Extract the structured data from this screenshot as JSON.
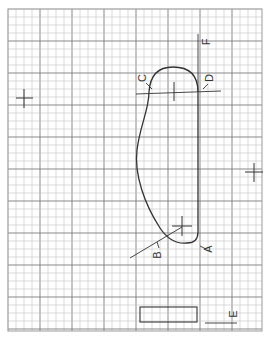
{
  "diagram": {
    "type": "pattern-sheet-on-grid",
    "grid": {
      "origin_x": 8,
      "origin_y": 9,
      "width": 254,
      "height": 322,
      "minor_spacing": 8,
      "major_every": 4,
      "minor_color": "#c4c4c4",
      "major_color": "#7a7a7a",
      "border_color": "#9a9a9a"
    },
    "labels": {
      "A": "A",
      "B": "B",
      "C": "C",
      "D": "D",
      "E": "E",
      "F": "F"
    },
    "registration_marks": [
      {
        "name": "left-cross",
        "x": 24,
        "y": 98
      },
      {
        "name": "right-cross",
        "x": 254,
        "y": 172
      },
      {
        "name": "top-cross",
        "x": 174,
        "y": 92
      },
      {
        "name": "bottom-cross",
        "x": 182,
        "y": 224
      }
    ],
    "colors": {
      "ink": "#333333",
      "paper": "#ffffff"
    }
  }
}
